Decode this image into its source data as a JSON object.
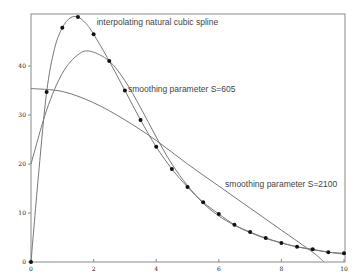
{
  "chart_data": {
    "type": "line",
    "title": "",
    "xlabel": "",
    "ylabel": "",
    "xlim": [
      0,
      10
    ],
    "ylim": [
      0,
      50
    ],
    "grid": false,
    "legend": "none (inline annotations)",
    "xticks": [
      0,
      2,
      4,
      6,
      8,
      10
    ],
    "yticks": [
      0,
      10,
      20,
      30,
      40
    ],
    "points": {
      "x": [
        0,
        0.5,
        1.0,
        1.5,
        2.0,
        2.5,
        3.0,
        3.5,
        4.0,
        4.5,
        5.0,
        5.5,
        6.0,
        6.5,
        7.0,
        7.5,
        8.0,
        8.5,
        9.0,
        9.5,
        10.0
      ],
      "y": [
        0,
        34.7,
        47.8,
        50.0,
        46.5,
        41.0,
        35.0,
        29.0,
        23.5,
        19.0,
        15.3,
        12.2,
        9.8,
        7.6,
        6.1,
        4.9,
        3.9,
        3.1,
        2.6,
        2.0,
        1.8
      ]
    },
    "series": [
      {
        "name": "interpolating natural cubic spline",
        "x": [
          0,
          0.25,
          0.5,
          0.75,
          1.0,
          1.25,
          1.5,
          1.75,
          2.0,
          2.5,
          3.0,
          3.5,
          4.0,
          4.5,
          5.0,
          5.5,
          6.0,
          6.5,
          7.0,
          7.5,
          8.0,
          8.5,
          9.0,
          9.5,
          10.0
        ],
        "y": [
          0,
          18.5,
          34.7,
          43.5,
          47.8,
          49.8,
          50.0,
          48.7,
          46.5,
          41.0,
          35.0,
          29.0,
          23.5,
          19.0,
          15.3,
          12.2,
          9.8,
          7.6,
          6.1,
          4.9,
          3.9,
          3.1,
          2.6,
          2.0,
          1.8
        ]
      },
      {
        "name": "smoothing parameter S=605",
        "x": [
          0,
          0.5,
          1.0,
          1.5,
          1.9,
          2.5,
          3.0,
          3.5,
          4.0,
          4.5,
          5.0,
          5.5,
          6.0,
          6.5,
          7.0,
          7.5,
          8.0,
          8.5,
          9.0,
          9.5,
          10.0
        ],
        "y": [
          20.0,
          31.0,
          38.5,
          42.3,
          43.0,
          41.0,
          37.0,
          31.5,
          25.5,
          20.0,
          15.6,
          12.0,
          9.4,
          7.5,
          6.0,
          4.8,
          3.9,
          3.1,
          2.5,
          2.0,
          1.6
        ]
      },
      {
        "name": "smoothing parameter S=2100",
        "x": [
          0,
          1.0,
          2.0,
          3.0,
          4.0,
          5.0,
          6.0,
          7.0,
          8.0,
          9.0,
          9.36
        ],
        "y": [
          35.4,
          34.8,
          32.5,
          29.0,
          24.8,
          20.0,
          15.5,
          11.0,
          6.5,
          2.0,
          0
        ]
      }
    ],
    "annotations": [
      {
        "text": "interpolating natural cubic spline",
        "x": 2.1,
        "y": 48.3
      },
      {
        "text": "smoothing parameter S=605",
        "x": 3.1,
        "y": 34.6
      },
      {
        "text": "smoothing parameter S=2100",
        "x": 6.2,
        "y": 15.3
      }
    ]
  },
  "colors": {
    "frame": "#8a8a8a",
    "curve": "#777777",
    "point": "#111111",
    "background": "#ffffff"
  }
}
